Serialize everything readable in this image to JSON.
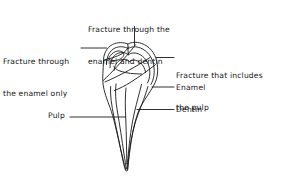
{
  "figure": {
    "stroke_color": "#1a1a1a",
    "background_color": "#ffffff",
    "labels": [
      {
        "id": "fracture-enamel-dentin",
        "line1": "Fracture through the",
        "line2": "enamel and dentin",
        "leader": "vertical-down"
      },
      {
        "id": "fracture-enamel-only",
        "line1": "Fracture through",
        "line2": "the enamel only",
        "leader": "horizontal-right"
      },
      {
        "id": "fracture-includes-pulp",
        "line1": "Fracture that includes",
        "line2": "the pulp",
        "leader": "horizontal-left"
      },
      {
        "id": "enamel",
        "line1": "Enamel",
        "line2": "",
        "leader": "horizontal-left"
      },
      {
        "id": "dentin",
        "line1": "Dentin",
        "line2": "",
        "leader": "horizontal-left"
      },
      {
        "id": "pulp",
        "line1": "Pulp",
        "line2": "",
        "leader": "horizontal-right"
      }
    ]
  }
}
